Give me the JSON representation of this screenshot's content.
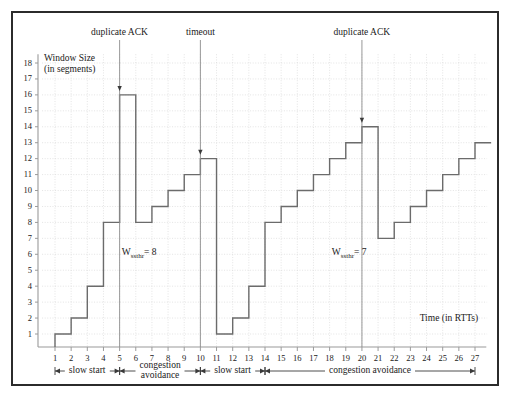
{
  "figure": {
    "y_axis": {
      "title_line1": "Window Size",
      "title_line2": "(in segments)",
      "ticks": [
        1,
        2,
        3,
        4,
        5,
        6,
        7,
        8,
        9,
        10,
        11,
        12,
        13,
        14,
        15,
        16,
        17,
        18
      ]
    },
    "x_axis": {
      "title": "Time (in RTTs)",
      "ticks": [
        1,
        2,
        3,
        4,
        5,
        6,
        7,
        8,
        9,
        10,
        11,
        12,
        13,
        14,
        15,
        16,
        17,
        18,
        19,
        20,
        21,
        22,
        23,
        24,
        25,
        26,
        27
      ]
    },
    "events": [
      {
        "label": "duplicate ACK",
        "rtt": 5,
        "value": 16
      },
      {
        "label": "timeout",
        "rtt": 10,
        "value": 12
      },
      {
        "label": "duplicate ACK",
        "rtt": 20,
        "value": 14
      }
    ],
    "threshold_labels": [
      {
        "text": "W",
        "sub": "ssthr",
        "eq": "= 8",
        "rtt": 6.0,
        "value": 6.0
      },
      {
        "text": "W",
        "sub": "ssthr",
        "eq": "= 7",
        "rtt": 19.0,
        "value": 6.0
      }
    ],
    "phases": [
      {
        "label": "slow start",
        "from": 1,
        "to": 5
      },
      {
        "label": "congestion avoidance",
        "from": 5,
        "to": 10
      },
      {
        "label": "slow start",
        "from": 10,
        "to": 14
      },
      {
        "label": "congestion avoidance",
        "from": 14,
        "to": 27
      }
    ],
    "colors": {
      "border": "#2b2b2b",
      "curve": "#6b6b6b",
      "axis": "#9a9a9a",
      "grid": "#d8d8d8",
      "event_line": "#8c8c8c",
      "text": "#1a1a1a"
    }
  },
  "chart_data": {
    "type": "line",
    "title": "",
    "xlabel": "Time (in RTTs)",
    "ylabel": "Window Size (in segments)",
    "xlim": [
      0,
      27.8
    ],
    "ylim": [
      0,
      18.6
    ],
    "grid": true,
    "legend": "none",
    "step_style": "post",
    "x": [
      1,
      2,
      3,
      4,
      5,
      6,
      7,
      8,
      9,
      10,
      11,
      12,
      13,
      14,
      15,
      16,
      17,
      18,
      19,
      20,
      21,
      22,
      23,
      24,
      25,
      26,
      27
    ],
    "values": [
      1,
      2,
      4,
      8,
      16,
      8,
      9,
      10,
      11,
      12,
      1,
      2,
      4,
      8,
      9,
      10,
      11,
      12,
      13,
      14,
      7,
      8,
      9,
      10,
      11,
      12,
      13
    ],
    "annotations": [
      {
        "text": "duplicate ACK",
        "x": 5,
        "y": 16
      },
      {
        "text": "timeout",
        "x": 10,
        "y": 12
      },
      {
        "text": "duplicate ACK",
        "x": 20,
        "y": 14
      },
      {
        "text": "Wssthr = 8",
        "x": 6,
        "y": 6
      },
      {
        "text": "Wssthr = 7",
        "x": 19,
        "y": 6
      }
    ]
  }
}
